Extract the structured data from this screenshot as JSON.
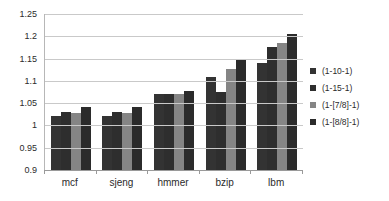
{
  "chart_data": {
    "type": "bar",
    "title": "",
    "xlabel": "",
    "ylabel": "",
    "ylim": [
      0.9,
      1.25
    ],
    "ytick_step": 0.05,
    "grid": true,
    "legend_position": "right",
    "categories": [
      "mcf",
      "sjeng",
      "hmmer",
      "bzip",
      "lbm"
    ],
    "ytick_labels": [
      "1.25",
      "1.2",
      "1.15",
      "1.1",
      "1.05",
      "1",
      "0.95",
      "0.9"
    ],
    "ytick_values": [
      1.25,
      1.2,
      1.15,
      1.1,
      1.05,
      1.0,
      0.95,
      0.9
    ],
    "series": [
      {
        "name": "(1-10-1)",
        "color": "#333333",
        "values": [
          1.021,
          1.021,
          1.07,
          1.108,
          1.141
        ]
      },
      {
        "name": "(1-15-1)",
        "color": "#2e2e2e",
        "values": [
          1.031,
          1.031,
          1.071,
          1.075,
          1.177
        ]
      },
      {
        "name": "(1-[7/8]-1)",
        "color": "#858585",
        "values": [
          1.029,
          1.029,
          1.071,
          1.127,
          1.184
        ]
      },
      {
        "name": "(1-[8/8]-1)",
        "color": "#2b2b2b",
        "values": [
          1.042,
          1.042,
          1.077,
          1.147,
          1.205
        ]
      }
    ]
  }
}
